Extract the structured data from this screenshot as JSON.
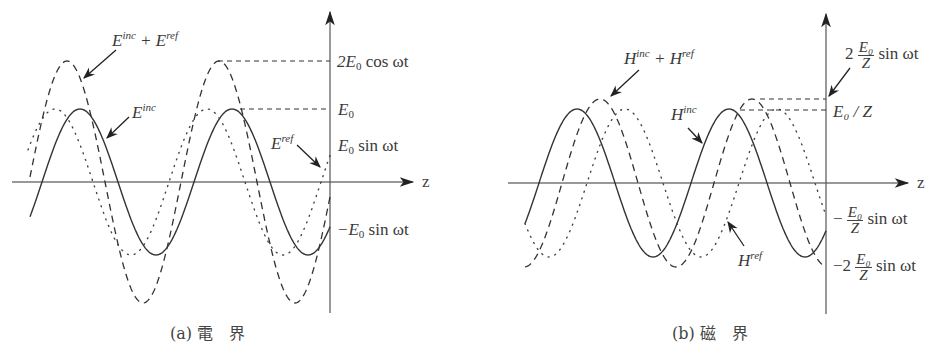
{
  "panels": [
    {
      "id": "a",
      "caption": "(a) 電　界",
      "axis": {
        "x": 330,
        "y0": 182,
        "top": 10,
        "bottom": 313,
        "zstart": 12,
        "zend": 415,
        "zlabel": "z"
      },
      "waves": {
        "inc": {
          "style": "solid",
          "amp": 73,
          "period": 152,
          "peakx": 80,
          "x0": 30,
          "x1": 330
        },
        "ref": {
          "style": "dotted",
          "amp": 73,
          "period": 152,
          "peakx": 55,
          "x0": 30,
          "x1": 330,
          "mirror": true
        },
        "sum": {
          "style": "dashed",
          "amp": 121,
          "period": 152,
          "peakx": 65,
          "x0": 30,
          "x1": 330
        }
      },
      "labels": {
        "sum_label": "E",
        "sum_sup1": "inc",
        "sum_plus": " + E",
        "sum_sup2": "ref",
        "inc_label": "E",
        "inc_sup": "inc",
        "ref_label": "E",
        "ref_sup": "ref",
        "tick_2e0": "2E",
        "tick_2e0_sub": "0",
        "tick_2e0_rest": " cos ωt",
        "tick_e0": "E",
        "tick_e0_sub": "0",
        "tick_e0sin": "E",
        "tick_e0sin_sub": "0",
        "tick_e0sin_rest": " sin ωt",
        "tick_neg": "−E",
        "tick_neg_sub": "0",
        "tick_neg_rest": " sin ωt"
      }
    },
    {
      "id": "b",
      "caption": "(b) 磁　界",
      "axis": {
        "x": 826,
        "y0": 183,
        "top": 12,
        "bottom": 314,
        "zstart": 508,
        "zend": 910,
        "zlabel": "z"
      },
      "labels": {
        "sum_label": "H",
        "sum_sup1": "inc",
        "sum_plus": " + H",
        "sum_sup2": "ref",
        "inc_label": "H",
        "inc_sup": "inc",
        "ref_label": "H",
        "ref_sup": "ref",
        "tick_2": "2",
        "tick_num": "E₀",
        "tick_den": "Z",
        "tick_sin": "sin ωt",
        "tick_e0z": "E₀ / Z",
        "tick_neg1": "−",
        "tick_neg2": "−2"
      }
    }
  ],
  "figure_caption": "図 ... 定在波的分布 ... (cut off)"
}
